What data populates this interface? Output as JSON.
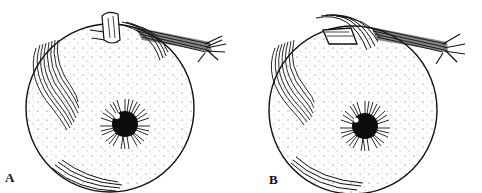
{
  "figure": {
    "panels": [
      {
        "label": "A",
        "description": "Eyeball with superior oblique tendon intact over superior rectus muscle insertion"
      },
      {
        "label": "B",
        "description": "Eyeball with superior rectus insertion displaced beneath muscle band"
      }
    ]
  },
  "colors": {
    "ink": "#111111",
    "background": "#ffffff"
  }
}
